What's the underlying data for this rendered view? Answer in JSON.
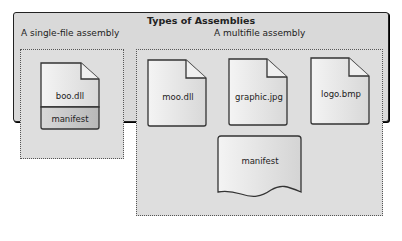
{
  "header_fragment": "",
  "diagram": {
    "title": "Types of Assemblies",
    "single_file": {
      "heading": "A single-file assembly",
      "file": {
        "name": "boo.dll",
        "manifest": "manifest"
      }
    },
    "multifile": {
      "heading": "A multifile assembly",
      "files": [
        {
          "name": "moo.dll"
        },
        {
          "name": "graphic.jpg"
        },
        {
          "name": "logo.bmp"
        }
      ],
      "manifest": "manifest"
    }
  },
  "colors": {
    "panel_bg": "#d9d9d9",
    "border": "#222222",
    "file_gradient_start": "#f4f4f4",
    "file_gradient_end": "#dcdcdc",
    "manifest_band": "#c8c8c8"
  }
}
